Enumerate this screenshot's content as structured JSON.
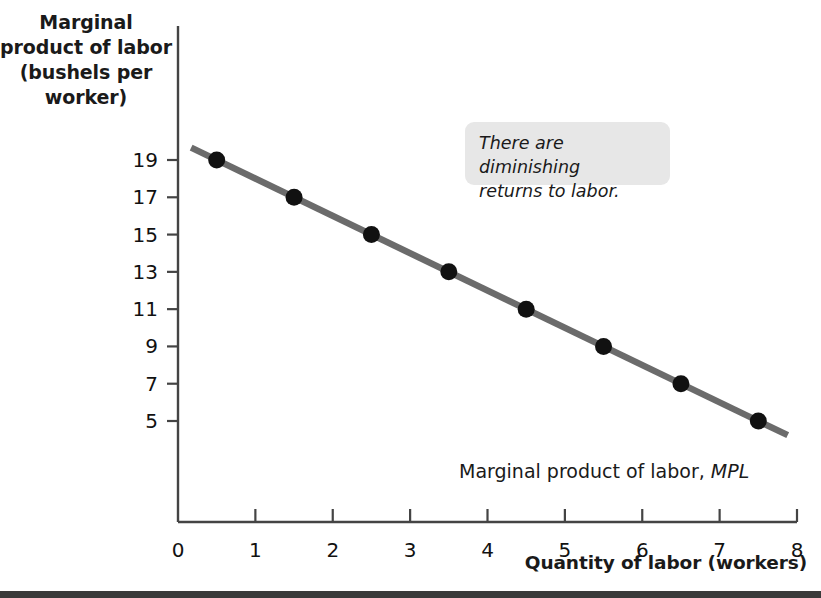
{
  "chart_data": {
    "type": "line",
    "title": "",
    "xlabel": "Quantity of labor (workers)",
    "ylabel": "Marginal product of labor (bushels per worker)",
    "xlim": [
      0,
      8
    ],
    "ylim": [
      4,
      20
    ],
    "grid": false,
    "legend_position": "inline-right",
    "x": [
      0.5,
      1.5,
      2.5,
      3.5,
      4.5,
      5.5,
      6.5,
      7.5
    ],
    "values": [
      19,
      17,
      15,
      13,
      11,
      9,
      7,
      5
    ],
    "series": [
      {
        "name": "Marginal product of labor, MPL",
        "x": [
          0.5,
          1.5,
          2.5,
          3.5,
          4.5,
          5.5,
          6.5,
          7.5
        ],
        "values": [
          19,
          17,
          15,
          13,
          11,
          9,
          7,
          5
        ],
        "line_color": "#6b6b6b",
        "marker_color": "#111111"
      }
    ],
    "x_ticks": [
      "0",
      "1",
      "2",
      "3",
      "4",
      "5",
      "6",
      "7",
      "8"
    ],
    "x_tick_values": [
      0,
      1,
      2,
      3,
      4,
      5,
      6,
      7,
      8
    ],
    "y_ticks": [
      "19",
      "17",
      "15",
      "13",
      "11",
      "9",
      "7",
      "5"
    ],
    "y_tick_values": [
      19,
      17,
      15,
      13,
      11,
      9,
      7,
      5
    ],
    "annotations": [
      {
        "name": "diminishing-returns-callout",
        "text": "There are diminishing returns to labor.",
        "style": "italic",
        "background": "#e7e7e7"
      }
    ]
  },
  "axes": {
    "y_title": "Marginal product of labor (bushels per worker)",
    "y_title_lines": [
      "Marginal",
      "product of labor",
      "(bushels per",
      "worker)"
    ],
    "x_title": "Quantity of labor (workers)"
  },
  "series_label": {
    "prefix": "Marginal product of labor, ",
    "symbol": "MPL"
  },
  "callout": {
    "line1": "There are diminishing",
    "line2": "returns to labor."
  },
  "colors": {
    "line": "#6b6b6b",
    "marker": "#111111",
    "axis": "#444444",
    "callout_bg": "#e7e7e7",
    "bottom_rule": "#3a3a3a",
    "text": "#1a1a1a"
  }
}
